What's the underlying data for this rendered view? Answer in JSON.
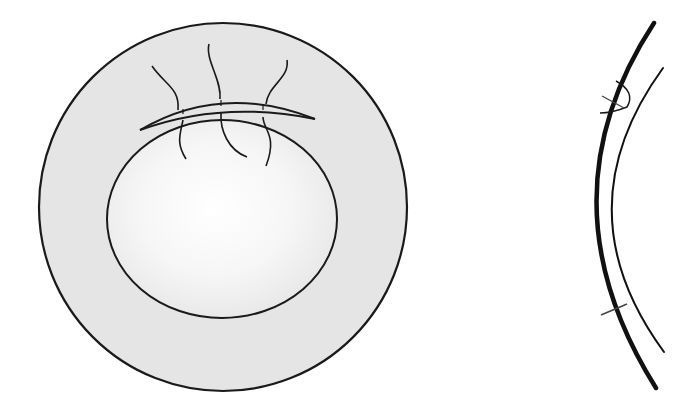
{
  "figure": {
    "type": "medical-illustration",
    "panels": [
      {
        "id": "front-view",
        "description": "Frontal view of a circular disc with an inner circle and a superior arcuate band crossed by three wavy lines"
      },
      {
        "id": "cross-section",
        "description": "Cross-sectional side view of two concentric curved layers with a hinged flap near the top and a short connector near the bottom"
      }
    ]
  },
  "colors": {
    "background": "#ffffff",
    "stroke": "#1a1a1a",
    "disc_fill": "#e6e6e6",
    "inner_center": "#ffffff",
    "inner_edge": "#e8e8e8",
    "connector": "#444444"
  }
}
